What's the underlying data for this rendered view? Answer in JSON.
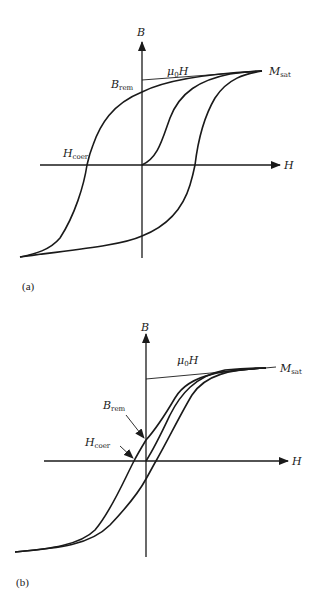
{
  "figure": {
    "panels": [
      {
        "id": "a",
        "panel_label": "(a)",
        "title": "Hysteresis loop of hard magnetic material",
        "axes": {
          "x_label": "H",
          "y_label": "B"
        },
        "labels": {
          "mu0H": {
            "main": "μ",
            "sub": "0",
            "tail": "H"
          },
          "msat": {
            "main": "M",
            "sub": "sat"
          },
          "brem": {
            "main": "B",
            "sub": "rem"
          },
          "hcoer": {
            "main": "H",
            "sub": "coer"
          }
        }
      },
      {
        "id": "b",
        "panel_label": "(b)",
        "title": "Hysteresis loop of soft magnetic material",
        "axes": {
          "x_label": "H",
          "y_label": "B"
        },
        "labels": {
          "mu0H": {
            "main": "μ",
            "sub": "0",
            "tail": "H"
          },
          "msat": {
            "main": "M",
            "sub": "sat"
          },
          "brem": {
            "main": "B",
            "sub": "rem"
          },
          "hcoer": {
            "main": "H",
            "sub": "coer"
          }
        }
      }
    ],
    "colors": {
      "ink": "#1a1a1a",
      "background": "#ffffff"
    }
  }
}
